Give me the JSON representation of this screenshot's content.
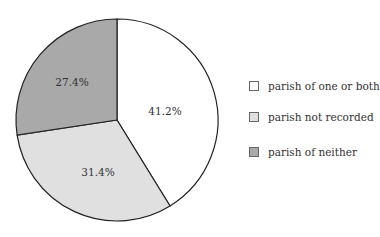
{
  "chart_data": {
    "type": "pie",
    "title": "",
    "categories": [
      "parish of one or both",
      "parish not recorded",
      "parish of neither"
    ],
    "values": [
      41.2,
      31.4,
      27.4
    ],
    "labels": [
      "41.2%",
      "31.4%",
      "27.4%"
    ],
    "colors": [
      "#ffffff",
      "#e0e0e0",
      "#a9a9a9"
    ],
    "start_angle": "12 o'clock",
    "direction": "clockwise",
    "legend_position": "right"
  },
  "legend": {
    "items": [
      {
        "label": "parish of one or both",
        "color": "#ffffff"
      },
      {
        "label": "parish not recorded",
        "color": "#e0e0e0"
      },
      {
        "label": "parish of neither",
        "color": "#a9a9a9"
      }
    ]
  }
}
